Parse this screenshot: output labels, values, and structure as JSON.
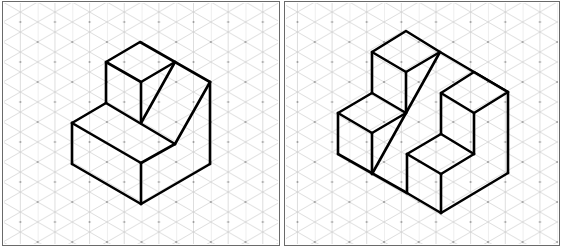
{
  "colors": {
    "line": "#000000",
    "grid": "#c8c8c8",
    "grid_dot": "#9a9a9a",
    "frame": "#6a6a6a",
    "paper": "#ffffff"
  },
  "grid": {
    "type": "isometric",
    "column_spacing_px": 17.3,
    "row_spacing_px": 40,
    "angle_deg": 30
  },
  "panels": [
    {
      "id": "left",
      "label": "Isometric drawing 1",
      "description": "L-shaped block: raised cube at back-left, low front block, sloped cut on right side",
      "vertices": {
        "top": [
          140,
          42
        ],
        "cube_left_top": [
          106,
          62
        ],
        "cube_front_top": [
          141,
          82
        ],
        "cube_right_top": [
          175,
          62
        ],
        "right_top": [
          210,
          82
        ],
        "cube_left_bottom": [
          106,
          103
        ],
        "cube_front_bottom": [
          141,
          123
        ],
        "ledge_left": [
          72,
          123
        ],
        "slope_bottom": [
          175,
          144
        ],
        "front_top": [
          141,
          163
        ],
        "left_bottom": [
          72,
          164
        ],
        "front_bottom": [
          141,
          204
        ],
        "right_bottom": [
          210,
          164
        ]
      }
    },
    {
      "id": "right",
      "label": "Isometric drawing 2",
      "description": "Stepped block with tall cube at back-left, sloped cut, and U-shaped notch at right",
      "vertices": {
        "top": [
          406,
          31
        ],
        "tall_left_top": [
          372,
          52
        ],
        "tall_front_top": [
          406,
          72
        ],
        "tall_right_top": [
          440,
          52
        ],
        "ridge": [
          474,
          72
        ],
        "right_top": [
          508,
          92
        ],
        "inner_left_top": [
          441,
          93
        ],
        "inner_front_top": [
          474,
          113
        ],
        "right_bottom": [
          508,
          173
        ],
        "tall_left_bottom": [
          372,
          93
        ],
        "tall_front_bottom": [
          406,
          113
        ],
        "small_left": [
          338,
          113
        ],
        "small_front_top": [
          372,
          133
        ],
        "small_left_bottom": [
          338,
          154
        ],
        "small_front_bottom": [
          372,
          174
        ],
        "inner_step_back": [
          441,
          134
        ],
        "inner_step_front": [
          474,
          154
        ],
        "rcube_left_top": [
          407,
          154
        ],
        "rcube_front_top": [
          441,
          174
        ],
        "rcube_left_bottom": [
          407,
          193
        ],
        "front_bottom": [
          441,
          213
        ]
      }
    }
  ]
}
